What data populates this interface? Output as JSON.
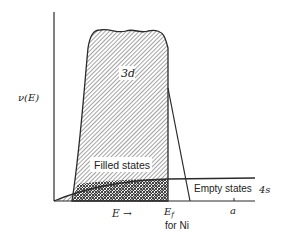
{
  "diagram": {
    "y_axis_label": "ν(E)",
    "x_axis_label": "E →",
    "band_3d_label": "3d",
    "filled_states_label": "Filled states",
    "empty_states_label": "Empty states",
    "band_4s_label": "4s",
    "fermi_label": "E",
    "fermi_subscript": "f",
    "fermi_note": "for Ni",
    "tick_a_label": "a"
  },
  "colors": {
    "line": "#2a2a2a",
    "hatch": "#555555",
    "background": "#ffffff"
  }
}
